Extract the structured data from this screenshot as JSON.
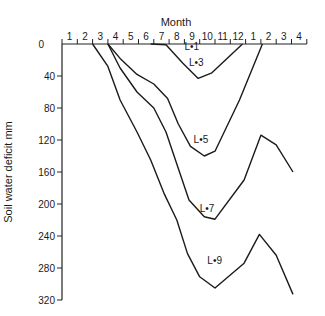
{
  "chart_data": {
    "type": "line",
    "title": "",
    "xlabel": "Month",
    "ylabel": "Soil water deficit mm",
    "x_tick_labels": [
      "1",
      "2",
      "3",
      "4",
      "5",
      "6",
      "7",
      "8",
      "9",
      "10",
      "11",
      "12",
      "1",
      "2",
      "3",
      "4"
    ],
    "y_ticks": [
      0,
      40,
      80,
      120,
      160,
      200,
      240,
      280,
      320
    ],
    "ylim": [
      0,
      320
    ],
    "y_inverted": true,
    "x_axis_position": "top",
    "grid": false,
    "x_units": "month index (1 = start of month 1; 17 = end of second-year month 4)",
    "series": [
      {
        "name": "L = 1",
        "label_pos": [
          9.0,
          8
        ],
        "points": []
      },
      {
        "name": "L = 3",
        "label_pos": [
          9.3,
          28
        ],
        "points": [
          [
            6.8,
            0
          ],
          [
            7.8,
            1
          ],
          [
            8.9,
            24
          ],
          [
            9.9,
            43
          ],
          [
            10.8,
            36
          ],
          [
            12.8,
            0
          ]
        ]
      },
      {
        "name": "L = 5",
        "label_pos": [
          9.6,
          124
        ],
        "points": [
          [
            4.0,
            0
          ],
          [
            4.8,
            18
          ],
          [
            5.9,
            38
          ],
          [
            7.0,
            50
          ],
          [
            7.9,
            68
          ],
          [
            8.6,
            100
          ],
          [
            9.4,
            128
          ],
          [
            10.3,
            140
          ],
          [
            11.0,
            134
          ],
          [
            12.6,
            70
          ],
          [
            14.1,
            0
          ]
        ]
      },
      {
        "name": "L = 7",
        "label_pos": [
          10.0,
          210
        ],
        "points": [
          [
            4.0,
            0
          ],
          [
            4.8,
            30
          ],
          [
            5.9,
            60
          ],
          [
            7.0,
            80
          ],
          [
            7.8,
            110
          ],
          [
            8.5,
            150
          ],
          [
            9.3,
            195
          ],
          [
            10.3,
            216
          ],
          [
            11.0,
            219
          ],
          [
            12.9,
            170
          ],
          [
            14.0,
            114
          ],
          [
            15.0,
            126
          ],
          [
            16.1,
            160
          ]
        ]
      },
      {
        "name": "L = 9",
        "label_pos": [
          10.5,
          275
        ],
        "points": [
          [
            3.0,
            0
          ],
          [
            4.0,
            28
          ],
          [
            4.8,
            70
          ],
          [
            5.9,
            110
          ],
          [
            6.8,
            145
          ],
          [
            7.7,
            188
          ],
          [
            8.5,
            220
          ],
          [
            9.2,
            262
          ],
          [
            10.0,
            291
          ],
          [
            11.0,
            305
          ],
          [
            12.9,
            274
          ],
          [
            13.9,
            238
          ],
          [
            15.0,
            264
          ],
          [
            16.1,
            313
          ]
        ]
      }
    ]
  },
  "axis": {
    "x_title": "Month",
    "y_title": "Soil water deficit mm"
  }
}
